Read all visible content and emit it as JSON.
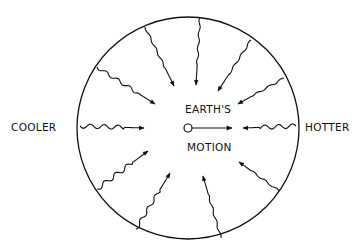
{
  "labels": {
    "left": "COOLER",
    "right": "HOTTER",
    "center_top": "EARTH'S",
    "center_bottom": "MOTION"
  },
  "diagram": {
    "circle": {
      "cx": 188,
      "cy": 128,
      "r": 111
    },
    "earth_marker": {
      "cx": 188,
      "cy": 128,
      "r": 4
    },
    "motion_arrow": {
      "x1": 192,
      "y1": 128,
      "x2": 232,
      "y2": 128
    },
    "radiation_arrows": [
      {
        "from": [
          145,
          27
        ],
        "to": [
          174,
          86
        ],
        "wave": "small"
      },
      {
        "from": [
          200,
          17
        ],
        "to": [
          196,
          85
        ],
        "wave": "small"
      },
      {
        "from": [
          251,
          40
        ],
        "to": [
          218,
          91
        ],
        "wave": "small"
      },
      {
        "from": [
          284,
          78
        ],
        "to": [
          238,
          104
        ],
        "wave": "small"
      },
      {
        "from": [
          97,
          67
        ],
        "to": [
          155,
          104
        ],
        "wave": "medium"
      },
      {
        "from": [
          80,
          126
        ],
        "to": [
          144,
          128
        ],
        "wave": "large"
      },
      {
        "from": [
          296,
          126
        ],
        "to": [
          243,
          128
        ],
        "wave": "large"
      },
      {
        "from": [
          97,
          189
        ],
        "to": [
          148,
          151
        ],
        "wave": "large"
      },
      {
        "from": [
          136,
          229
        ],
        "to": [
          170,
          173
        ],
        "wave": "medium"
      },
      {
        "from": [
          221,
          238
        ],
        "to": [
          203,
          176
        ],
        "wave": "small"
      },
      {
        "from": [
          279,
          191
        ],
        "to": [
          239,
          162
        ],
        "wave": "small"
      }
    ],
    "stroke_color": "#111111"
  }
}
